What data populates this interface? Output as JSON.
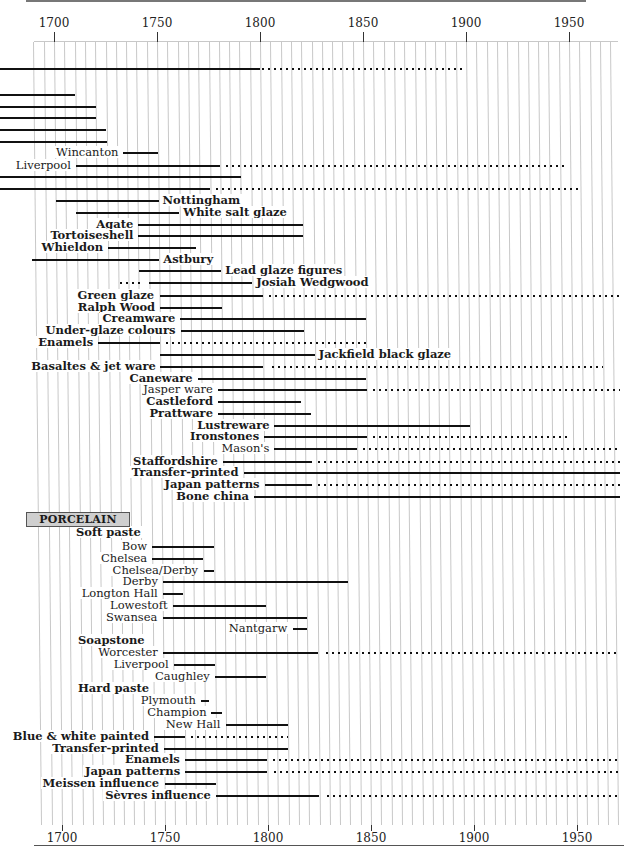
{
  "chart_data": {
    "type": "timeline",
    "title": "",
    "xlabel": "",
    "ylabel": "",
    "xlim": [
      1685,
      1975
    ],
    "x_ticks": [
      1700,
      1750,
      1800,
      1850,
      1900,
      1950
    ],
    "grid": true,
    "grid_step_years": 5,
    "legend": {
      "solid": "period of production",
      "dotted": "continued / revived production"
    },
    "sections": [
      {
        "label": "PORCELAIN",
        "y": 518
      }
    ],
    "rows": [
      {
        "y": 69,
        "label": "",
        "bold": false,
        "pos": "none",
        "solid": [
          1685,
          1800
        ],
        "dotted": [
          1800,
          1900
        ]
      },
      {
        "y": 95,
        "label": "",
        "bold": false,
        "pos": "none",
        "solid": [
          1685,
          1710
        ]
      },
      {
        "y": 107,
        "label": "",
        "bold": false,
        "pos": "none",
        "solid": [
          1685,
          1720
        ]
      },
      {
        "y": 118,
        "label": "",
        "bold": false,
        "pos": "none",
        "solid": [
          1685,
          1720
        ]
      },
      {
        "y": 130,
        "label": "",
        "bold": false,
        "pos": "none",
        "solid": [
          1685,
          1725
        ]
      },
      {
        "y": 142,
        "label": "",
        "bold": false,
        "pos": "none",
        "solid": [
          1685,
          1725
        ]
      },
      {
        "y": 153,
        "label": "Wincanton",
        "bold": false,
        "pos": "before",
        "solid": [
          1733,
          1750
        ]
      },
      {
        "y": 166,
        "label": "Liverpool",
        "bold": false,
        "pos": "before",
        "solid": [
          1710,
          1780
        ],
        "dotted": [
          1782,
          1947
        ]
      },
      {
        "y": 177,
        "label": "",
        "bold": false,
        "pos": "none",
        "solid": [
          1685,
          1790
        ]
      },
      {
        "y": 189,
        "label": "",
        "bold": false,
        "pos": "none",
        "solid": [
          1685,
          1775
        ],
        "dotted": [
          1777,
          1955
        ]
      },
      {
        "y": 201,
        "label": "Nottingham",
        "bold": true,
        "pos": "after",
        "solid": [
          1700,
          1750
        ]
      },
      {
        "y": 213,
        "label": "White salt glaze",
        "bold": true,
        "pos": "after",
        "solid": [
          1710,
          1760
        ]
      },
      {
        "y": 225,
        "label": "Agate",
        "bold": true,
        "pos": "before",
        "solid": [
          1740,
          1820
        ]
      },
      {
        "y": 236,
        "label": "Tortoiseshell",
        "bold": true,
        "pos": "before",
        "solid": [
          1740,
          1820
        ]
      },
      {
        "y": 248,
        "label": "Whieldon",
        "bold": true,
        "pos": "before",
        "solid": [
          1725,
          1768
        ]
      },
      {
        "y": 260,
        "label": "Astbury",
        "bold": true,
        "pos": "after",
        "solid": [
          1688,
          1750
        ]
      },
      {
        "y": 271,
        "label": "Lead glaze figures",
        "bold": true,
        "pos": "after",
        "solid": [
          1740,
          1780
        ]
      },
      {
        "y": 283,
        "label": "Josiah Wedgwood",
        "bold": true,
        "pos": "after",
        "dotted_pre": [
          1730,
          1742
        ],
        "solid": [
          1745,
          1795
        ]
      },
      {
        "y": 296,
        "label": "Green glaze",
        "bold": true,
        "pos": "before",
        "solid": [
          1750,
          1800
        ],
        "dotted": [
          1802,
          1975
        ]
      },
      {
        "y": 308,
        "label": "Ralph Wood",
        "bold": true,
        "pos": "before",
        "solid": [
          1750,
          1780
        ]
      },
      {
        "y": 319,
        "label": "Creamware",
        "bold": true,
        "pos": "before",
        "solid": [
          1760,
          1850
        ]
      },
      {
        "y": 331,
        "label": "Under-glaze colours",
        "bold": true,
        "pos": "before",
        "solid": [
          1760,
          1820
        ]
      },
      {
        "y": 343,
        "label": "Enamels",
        "bold": true,
        "pos": "before",
        "solid": [
          1720,
          1750
        ],
        "dotted": [
          1752,
          1850
        ]
      },
      {
        "y": 355,
        "label": "Jackfield black glaze",
        "bold": true,
        "pos": "after",
        "solid": [
          1750,
          1825
        ]
      },
      {
        "y": 367,
        "label": "Basaltes & jet ware",
        "bold": true,
        "pos": "before",
        "solid": [
          1750,
          1800
        ],
        "dotted": [
          1803,
          1965
        ]
      },
      {
        "y": 379,
        "label": "Caneware",
        "bold": true,
        "pos": "before",
        "solid": [
          1768,
          1850
        ]
      },
      {
        "y": 390,
        "label": "Jasper ware",
        "bold": false,
        "pos": "before",
        "solid": [
          1778,
          1850
        ],
        "dotted": [
          1852,
          1975
        ]
      },
      {
        "y": 402,
        "label": "Castleford",
        "bold": true,
        "pos": "before",
        "solid": [
          1778,
          1818
        ]
      },
      {
        "y": 414,
        "label": "Prattware",
        "bold": true,
        "pos": "before",
        "solid": [
          1778,
          1823
        ]
      },
      {
        "y": 426,
        "label": "Lustreware",
        "bold": true,
        "pos": "before",
        "solid": [
          1805,
          1900
        ]
      },
      {
        "y": 437,
        "label": "Ironstones",
        "bold": true,
        "pos": "before",
        "solid": [
          1800,
          1850
        ],
        "dotted": [
          1852,
          1948
        ]
      },
      {
        "y": 449,
        "label": "Mason's",
        "bold": false,
        "pos": "before",
        "solid": [
          1805,
          1845
        ],
        "dotted": [
          1847,
          1975
        ]
      },
      {
        "y": 462,
        "label": "Staffordshire",
        "bold": true,
        "pos": "before",
        "solid": [
          1780,
          1823
        ],
        "dotted": [
          1825,
          1975
        ]
      },
      {
        "y": 473,
        "label": "Transfer-printed",
        "bold": true,
        "pos": "before",
        "solid": [
          1790,
          1975
        ]
      },
      {
        "y": 485,
        "label": "Japan patterns",
        "bold": true,
        "pos": "before",
        "solid": [
          1800,
          1823
        ],
        "dotted": [
          1825,
          1975
        ]
      },
      {
        "y": 497,
        "label": "Bone china",
        "bold": true,
        "pos": "before",
        "solid": [
          1795,
          1975
        ]
      },
      {
        "y": 533,
        "label": "Soft paste",
        "bold": true,
        "pos": "heading",
        "x": 74
      },
      {
        "y": 547,
        "label": "Bow",
        "bold": false,
        "pos": "before",
        "solid": [
          1745,
          1775
        ]
      },
      {
        "y": 559,
        "label": "Chelsea",
        "bold": false,
        "pos": "before",
        "solid": [
          1745,
          1770
        ]
      },
      {
        "y": 571,
        "label": "Chelsea/Derby",
        "bold": false,
        "pos": "before",
        "solid": [
          1770,
          1775
        ]
      },
      {
        "y": 582,
        "label": "Derby",
        "bold": false,
        "pos": "before",
        "solid": [
          1750,
          1840
        ]
      },
      {
        "y": 594,
        "label": "Longton Hall",
        "bold": false,
        "pos": "before",
        "solid": [
          1750,
          1760
        ]
      },
      {
        "y": 606,
        "label": "Lowestoft",
        "bold": false,
        "pos": "before",
        "solid": [
          1755,
          1800
        ]
      },
      {
        "y": 618,
        "label": "Swansea",
        "bold": false,
        "pos": "before",
        "solid": [
          1750,
          1820
        ]
      },
      {
        "y": 629,
        "label": "Nantgarw",
        "bold": false,
        "pos": "before",
        "solid": [
          1813,
          1820
        ]
      },
      {
        "y": 641,
        "label": "Soapstone",
        "bold": true,
        "pos": "heading",
        "x": 76
      },
      {
        "y": 653,
        "label": "Worcester",
        "bold": false,
        "pos": "before",
        "solid": [
          1750,
          1825
        ],
        "dotted": [
          1828,
          1975
        ]
      },
      {
        "y": 665,
        "label": "Liverpool",
        "bold": false,
        "pos": "before",
        "solid": [
          1755,
          1775
        ]
      },
      {
        "y": 677,
        "label": "Caughley",
        "bold": false,
        "pos": "before",
        "solid": [
          1775,
          1800
        ]
      },
      {
        "y": 689,
        "label": "Hard paste",
        "bold": true,
        "pos": "heading",
        "x": 76
      },
      {
        "y": 701,
        "label": "Plymouth",
        "bold": false,
        "pos": "before",
        "solid": [
          1768,
          1772
        ]
      },
      {
        "y": 713,
        "label": "Champion",
        "bold": false,
        "pos": "before",
        "solid": [
          1773,
          1778
        ]
      },
      {
        "y": 725,
        "label": "New Hall",
        "bold": false,
        "pos": "before",
        "solid": [
          1780,
          1810
        ]
      },
      {
        "y": 737,
        "label": "Blue & white painted",
        "bold": true,
        "pos": "before",
        "solid": [
          1745,
          1760
        ],
        "dotted": [
          1762,
          1810
        ]
      },
      {
        "y": 749,
        "label": "Transfer-printed",
        "bold": true,
        "pos": "before",
        "solid": [
          1750,
          1810
        ]
      },
      {
        "y": 760,
        "label": "Enamels",
        "bold": true,
        "pos": "before",
        "solid": [
          1760,
          1800
        ],
        "dotted": [
          1802,
          1975
        ]
      },
      {
        "y": 772,
        "label": "Japan patterns",
        "bold": true,
        "pos": "before",
        "solid": [
          1760,
          1800
        ],
        "dotted": [
          1802,
          1975
        ]
      },
      {
        "y": 784,
        "label": "Meissen influence",
        "bold": true,
        "pos": "before",
        "solid": [
          1750,
          1775
        ]
      },
      {
        "y": 796,
        "label": "Sèvres influence",
        "bold": true,
        "pos": "before",
        "solid": [
          1775,
          1825
        ],
        "dotted": [
          1828,
          1975
        ]
      }
    ]
  },
  "axis": {
    "top_labels": [
      "1700",
      "1750",
      "1800",
      "1850",
      "1900",
      "1950"
    ],
    "bottom_labels": [
      "1700",
      "1750",
      "1800",
      "1850",
      "1900",
      "1950"
    ]
  },
  "section_label": "PORCELAIN"
}
